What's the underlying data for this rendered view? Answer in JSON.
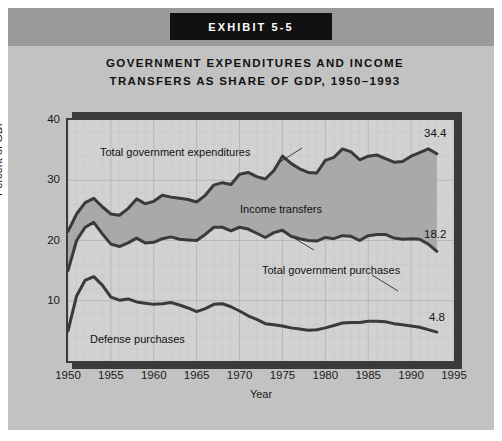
{
  "exhibit": {
    "badge_label": "EXHIBIT 5-5"
  },
  "chart_data": {
    "type": "area",
    "title_line1": "GOVERNMENT EXPENDITURES AND INCOME",
    "title_line2": "TRANSFERS AS SHARE OF GDP, 1950–1993",
    "xlabel": "Year",
    "ylabel": "Percent of GDP",
    "xlim": [
      1950,
      1995
    ],
    "ylim": [
      0,
      40
    ],
    "xticks": [
      "1950",
      "1955",
      "1960",
      "1965",
      "1970",
      "1975",
      "1980",
      "1985",
      "1990",
      "1995"
    ],
    "yticks": [
      "10",
      "20",
      "30",
      "40"
    ],
    "grid": true,
    "legend": "inline-annotations",
    "annotations": [
      {
        "name": "total-government-expenditures",
        "text": "Total government expenditures"
      },
      {
        "name": "income-transfers",
        "text": "Income transfers"
      },
      {
        "name": "total-government-purchases",
        "text": "Total government purchases"
      },
      {
        "name": "defense-purchases",
        "text": "Defense purchases"
      }
    ],
    "end_labels": [
      {
        "series": "Total government expenditures",
        "value": "34.4"
      },
      {
        "series": "Total government purchases",
        "value": "18.2"
      },
      {
        "series": "Defense purchases",
        "value": "4.8"
      }
    ],
    "x": [
      1950,
      1951,
      1952,
      1953,
      1954,
      1955,
      1956,
      1957,
      1958,
      1959,
      1960,
      1961,
      1962,
      1963,
      1964,
      1965,
      1966,
      1967,
      1968,
      1969,
      1970,
      1971,
      1972,
      1973,
      1974,
      1975,
      1976,
      1977,
      1978,
      1979,
      1980,
      1981,
      1982,
      1983,
      1984,
      1985,
      1986,
      1987,
      1988,
      1989,
      1990,
      1991,
      1992,
      1993
    ],
    "series": [
      {
        "name": "Total government expenditures",
        "values": [
          21.5,
          24.4,
          26.3,
          27.0,
          25.6,
          24.4,
          24.2,
          25.3,
          26.9,
          26.1,
          26.5,
          27.5,
          27.2,
          27.0,
          26.8,
          26.4,
          27.5,
          29.2,
          29.6,
          29.3,
          31.0,
          31.3,
          30.6,
          30.2,
          31.6,
          34.0,
          32.8,
          31.9,
          31.3,
          31.2,
          33.3,
          33.8,
          35.2,
          34.7,
          33.4,
          34.0,
          34.2,
          33.6,
          33.0,
          33.1,
          34.0,
          34.6,
          35.2,
          34.4
        ]
      },
      {
        "name": "Total government purchases",
        "values": [
          15.0,
          20.0,
          22.2,
          23.0,
          21.1,
          19.4,
          19.0,
          19.6,
          20.4,
          19.6,
          19.7,
          20.3,
          20.6,
          20.2,
          20.1,
          20.0,
          21.0,
          22.2,
          22.2,
          21.6,
          22.2,
          21.9,
          21.2,
          20.5,
          21.3,
          21.7,
          20.7,
          20.3,
          20.0,
          19.9,
          20.5,
          20.3,
          20.8,
          20.7,
          20.0,
          20.8,
          21.0,
          21.0,
          20.4,
          20.2,
          20.3,
          20.2,
          19.4,
          18.2
        ]
      },
      {
        "name": "Defense purchases",
        "values": [
          5.0,
          10.8,
          13.4,
          14.0,
          12.6,
          10.6,
          10.1,
          10.3,
          9.8,
          9.6,
          9.4,
          9.5,
          9.7,
          9.3,
          8.8,
          8.2,
          8.7,
          9.4,
          9.5,
          9.0,
          8.3,
          7.5,
          6.9,
          6.2,
          6.0,
          5.8,
          5.5,
          5.3,
          5.1,
          5.2,
          5.5,
          5.9,
          6.3,
          6.4,
          6.4,
          6.6,
          6.6,
          6.5,
          6.2,
          6.0,
          5.8,
          5.6,
          5.2,
          4.8
        ]
      }
    ]
  }
}
